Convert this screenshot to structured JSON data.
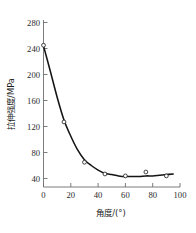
{
  "chart_data": {
    "type": "line",
    "title": "",
    "subtitle": "",
    "xlabel": "角度/(°)",
    "ylabel": "拉伸强度/MPa",
    "xlim": [
      0,
      100
    ],
    "ylim": [
      0,
      290
    ],
    "xticks": [
      0,
      20,
      40,
      60,
      80,
      100
    ],
    "xtick_labels": [
      "0",
      "20",
      "40",
      "60",
      "80",
      "100"
    ],
    "yticks": [
      40,
      80,
      120,
      160,
      200,
      240,
      280
    ],
    "ytick_labels": [
      "40",
      "80",
      "120",
      "160",
      "200",
      "240",
      "280"
    ],
    "grid": false,
    "legend": null,
    "series": [
      {
        "name": "拉伸强度",
        "marker": "open-circle",
        "line_color": "#141414",
        "marker_color": "#232323",
        "x": [
          0,
          15,
          30,
          45,
          60,
          75,
          90
        ],
        "values": [
          245,
          127,
          65,
          47,
          44,
          50,
          44
        ]
      }
    ],
    "fit_curve": {
      "description": "smooth exponential-decay fit through the data",
      "x": [
        0,
        5,
        10,
        15,
        20,
        25,
        30,
        35,
        40,
        45,
        50,
        55,
        60,
        65,
        70,
        75,
        80,
        85,
        90,
        95
      ],
      "y": [
        244,
        205,
        165,
        130,
        105,
        84,
        69,
        60,
        53,
        48,
        46,
        44,
        43,
        43,
        43,
        44,
        44,
        45,
        46,
        47
      ]
    },
    "annotations": []
  },
  "axes": {
    "x_axis_name": "x-axis",
    "y_axis_name": "y-axis"
  }
}
